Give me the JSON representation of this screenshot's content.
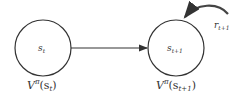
{
  "diagram": {
    "nodes": [
      {
        "id": "s_t",
        "label": "s",
        "sub": "t",
        "value_label": "V",
        "value_sup": "π",
        "value_arg": "(s",
        "value_arg_sub": "t",
        "value_close": ")"
      },
      {
        "id": "s_t1",
        "label": "s",
        "sub": "t+1",
        "value_label": "V",
        "value_sup": "π",
        "value_arg": "(s",
        "value_arg_sub": "t+1",
        "value_close": ")"
      }
    ],
    "edges": [
      {
        "from": "s_t",
        "to": "s_t1",
        "type": "straight-arrow"
      }
    ],
    "reward": {
      "label": "r",
      "sub": "t+1",
      "type": "curved-arrow-into-node",
      "target": "s_t1"
    },
    "colors": {
      "stroke": "#333333",
      "background": "#ffffff"
    }
  }
}
